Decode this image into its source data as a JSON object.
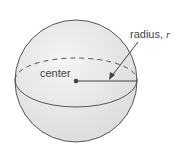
{
  "diagram": {
    "labels": {
      "center": "center",
      "radius_prefix": "radius, ",
      "radius_var": "r"
    },
    "colors": {
      "sphere_fill": "#e9e9e9",
      "stroke": "#555555",
      "text": "#444444"
    }
  }
}
